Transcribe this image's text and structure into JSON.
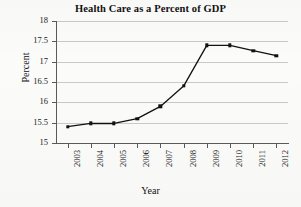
{
  "chart_data": {
    "type": "line",
    "title": "Health Care as a Percent of GDP",
    "xlabel": "Year",
    "ylabel": "Percent",
    "categories": [
      "2003",
      "2004",
      "2005",
      "2006",
      "2007",
      "2008",
      "2009",
      "2010",
      "2011",
      "2012"
    ],
    "values": [
      15.4,
      15.48,
      15.48,
      15.6,
      15.9,
      16.4,
      17.4,
      17.4,
      17.27,
      17.15
    ],
    "ylim": [
      15,
      18
    ],
    "ytick_labels": [
      "15",
      "15.5",
      "16",
      "16.5",
      "17",
      "17.5",
      "18"
    ],
    "ytick_values": [
      15,
      15.5,
      16,
      16.5,
      17,
      17.5,
      18
    ],
    "grid": "horizontal",
    "legend": "none",
    "line_color": "#111111",
    "marker": "square",
    "marker_color": "#111111",
    "gridline_color": "#c9c9c6",
    "background_color": "#fbfbf9"
  }
}
